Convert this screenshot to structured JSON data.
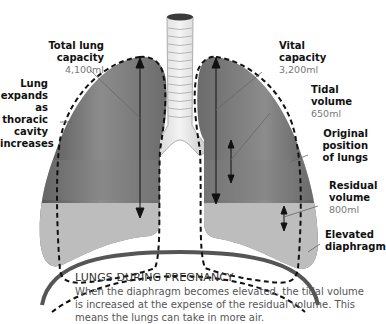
{
  "labels": {
    "total_lung_capacity": {
      "title_line1": "Total lung",
      "title_line2": "capacity",
      "value": "4,100ml"
    },
    "lung_expands": {
      "line1": "Lung",
      "line2": "expands as",
      "line3": "thoracic",
      "line4": "cavity",
      "line5": "increases"
    },
    "vital_capacity": {
      "title_line1": "Vital",
      "title_line2": "capacity",
      "value": "3,200ml"
    },
    "tidal_volume": {
      "title_line1": "Tidal",
      "title_line2": "volume",
      "value": "650ml"
    },
    "original_position": {
      "line1": "Original",
      "line2": "position",
      "line3": "of lungs"
    },
    "residual_volume": {
      "title_line1": "Residual",
      "title_line2": "volume",
      "value": "800ml"
    },
    "elevated_diaphragm": {
      "line1": "Elevated",
      "line2": "diaphragm"
    }
  },
  "caption": {
    "title": "LUNGS DURING PREGNANCY",
    "body": "When the diaphragm becomes elevated, the tidal volume is increased at the expense of the residual volume. This means the lungs can take in more air."
  },
  "colors": {
    "lung_dark": "#5a5a5a",
    "lung_mid": "#8a8a8a",
    "lung_light": "#b9b9b9",
    "diaphragm": "#555555",
    "trachea": "#e6e6e6",
    "dashed_outline": "#111111"
  }
}
